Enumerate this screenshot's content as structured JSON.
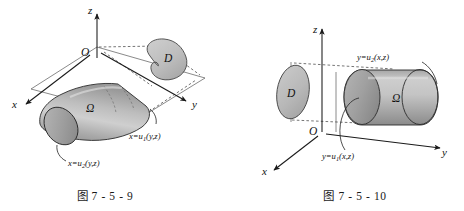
{
  "figure": {
    "panels": [
      {
        "id": "left",
        "caption": "图 7 - 5 - 9",
        "axes": {
          "x": "x",
          "y": "y",
          "z": "z",
          "origin": "O"
        },
        "solid_label": "Ω",
        "projection_label": "D",
        "surfaces": [
          {
            "equation": "x=u",
            "subscript": "1",
            "args": "(y,z)"
          },
          {
            "equation": "x=u",
            "subscript": "2",
            "args": "(y,z)"
          }
        ]
      },
      {
        "id": "right",
        "caption": "图 7 - 5 - 10",
        "axes": {
          "x": "x",
          "y": "y",
          "z": "z",
          "origin": "O"
        },
        "solid_label": "Ω",
        "projection_label": "D",
        "surfaces": [
          {
            "equation": "y=u",
            "subscript": "2",
            "args": "(x,z)"
          },
          {
            "equation": "y=u",
            "subscript": "1",
            "args": "(x,z)"
          }
        ]
      }
    ],
    "colors": {
      "background": "#ffffff",
      "ink": "#1a1a1a",
      "solid_fill_light": "#d6d6d6",
      "solid_fill_dark": "#8f8f8f",
      "region_fill": "#c2c2c2",
      "dashed": "#3a3a3a"
    }
  }
}
